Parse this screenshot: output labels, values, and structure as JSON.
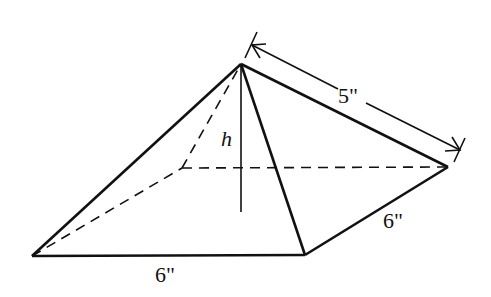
{
  "diagram": {
    "type": "square-pyramid",
    "labels": {
      "slant_height": "5\"",
      "base_front": "6\"",
      "base_side": "6\"",
      "height": "h"
    },
    "colors": {
      "line": "#111111",
      "background": "#ffffff"
    }
  }
}
